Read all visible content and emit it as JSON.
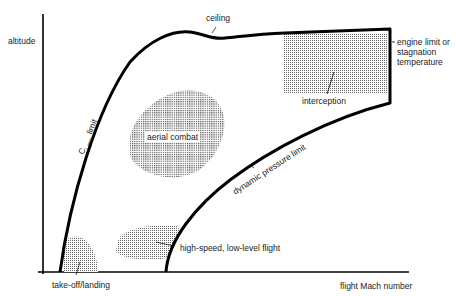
{
  "diagram": {
    "title": "",
    "axes": {
      "y_label": "altitude",
      "x_label": "flight Mach number"
    },
    "boundaries": {
      "ceiling": "ceiling",
      "cl_max_prefix": "C",
      "cl_max_sub": "L max",
      "cl_max_suffix": " limit",
      "engine_limit": [
        "engine limit or",
        "stagnation",
        "temperature"
      ],
      "dynamic_pressure": "dynamic pressure limit"
    },
    "regions": {
      "aerial_combat": "aerial combat",
      "interception": "interception",
      "takeoff_landing": "take-off/landing",
      "high_speed_low_level": "high-speed, low-level flight"
    },
    "colors": {
      "line": "#000000",
      "fill_dots": "#555555",
      "background": "#ffffff"
    }
  }
}
